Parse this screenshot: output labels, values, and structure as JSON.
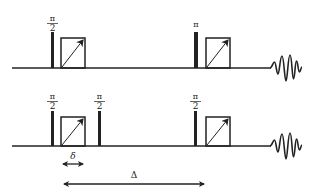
{
  "colors": {
    "ink": "#222222",
    "background": "#ffffff"
  },
  "sequences": [
    {
      "name": "spin-echo",
      "pulses": [
        {
          "label_num": "π",
          "label_den": "2",
          "kind": "pi-half"
        },
        {
          "label_num": "π",
          "label_den": "",
          "kind": "pi"
        }
      ],
      "gradients": 2,
      "signal": "fid"
    },
    {
      "name": "stimulated-echo",
      "pulses": [
        {
          "label_num": "π",
          "label_den": "2",
          "kind": "pi-half"
        },
        {
          "label_num": "π",
          "label_den": "2",
          "kind": "pi-half"
        },
        {
          "label_num": "π",
          "label_den": "2",
          "kind": "pi-half"
        }
      ],
      "gradients": 2,
      "signal": "fid"
    }
  ],
  "annotations": {
    "delta_small": "δ",
    "delta_big": "Δ"
  }
}
